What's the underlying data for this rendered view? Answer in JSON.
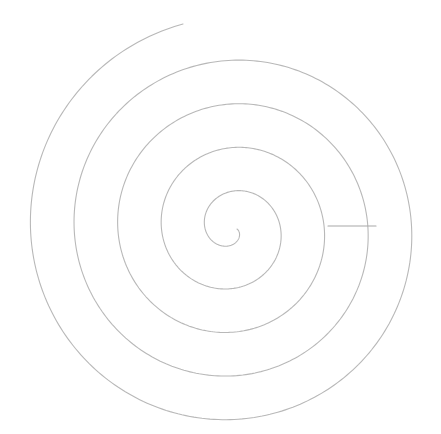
{
  "diagram": {
    "type": "archimedean-spiral",
    "canvas": {
      "width": 441,
      "height": 434,
      "background": "#ffffff"
    },
    "spiral": {
      "center": [
        232,
        229
      ],
      "start_radius": 5,
      "growth_per_radian": 7.25,
      "start_angle_deg": 0,
      "end_radius": 215,
      "direction": "clockwise",
      "end_point": [
        183,
        24
      ],
      "stroke_color": "#b8b8b8",
      "stroke_width": 1.1
    },
    "connector": {
      "from": [
        328,
        226
      ],
      "to": [
        376,
        226
      ],
      "stroke_color": "#a8a8a8",
      "stroke_width": 1.1
    }
  }
}
